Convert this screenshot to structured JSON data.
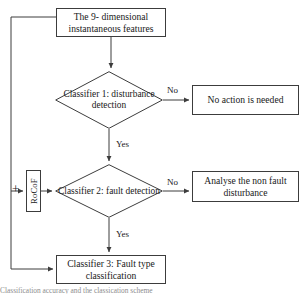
{
  "diagram": {
    "type": "flowchart",
    "stroke_color": "#3c3c3c",
    "background": "#ffffff",
    "nodes": {
      "features": {
        "shape": "rectangle",
        "line1": "The 9- dimensional",
        "line2": "instantaneous features"
      },
      "classifier1": {
        "shape": "diamond",
        "line1": "Classifier 1:",
        "line2": "disturbance",
        "line3": "detection"
      },
      "no_action": {
        "shape": "rectangle",
        "line1": "No action is needed"
      },
      "rocof": {
        "shape": "rectangle-vertical",
        "label": "RoCoF"
      },
      "classifier2": {
        "shape": "diamond",
        "line1": "Classifier 2:",
        "line2": "fault  detection"
      },
      "analyse": {
        "shape": "rectangle",
        "line1": "Analyse the non fault",
        "line2": "disturbance"
      },
      "classifier3": {
        "shape": "rectangle",
        "line1": "Classifier 3: Fault type",
        "line2": "classification"
      }
    },
    "edge_labels": {
      "no_1": "No",
      "yes_1": "Yes",
      "no_2": "No",
      "yes_2": "Yes",
      "plus": "+"
    },
    "caption": "Classification accuracy and the classication scheme"
  }
}
